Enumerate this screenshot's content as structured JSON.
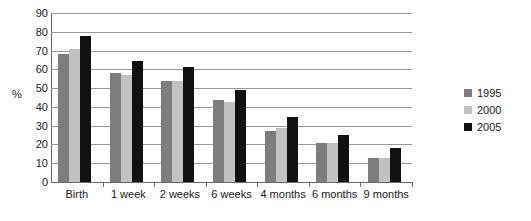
{
  "chart_data": {
    "type": "bar",
    "title": "",
    "subtitle": "",
    "xlabel": "",
    "ylabel": "%",
    "ylim": [
      0,
      90
    ],
    "ytick_step": 10,
    "yticks": [
      0,
      10,
      20,
      30,
      40,
      50,
      60,
      70,
      80,
      90
    ],
    "grid": true,
    "legend_position": "right",
    "categories": [
      "Birth",
      "1 week",
      "2 weeks",
      "6 weeks",
      "4 months",
      "6 months",
      "9 months"
    ],
    "series": [
      {
        "name": "1995",
        "color": "#7d7d7d",
        "values": [
          68,
          58,
          54,
          43.5,
          27,
          21,
          13
        ]
      },
      {
        "name": "2000",
        "color": "#c2c2c2",
        "values": [
          71,
          57,
          54,
          42.5,
          28.5,
          21,
          13
        ]
      },
      {
        "name": "2005",
        "color": "#111111",
        "values": [
          78,
          64.5,
          61,
          49,
          34.5,
          25,
          18
        ]
      }
    ],
    "annotations": []
  },
  "legend": {
    "entries": [
      {
        "label": "1995",
        "color": "#7d7d7d"
      },
      {
        "label": "2000",
        "color": "#c2c2c2"
      },
      {
        "label": "2005",
        "color": "#111111"
      }
    ]
  },
  "axis": {
    "unit_label": "%"
  }
}
